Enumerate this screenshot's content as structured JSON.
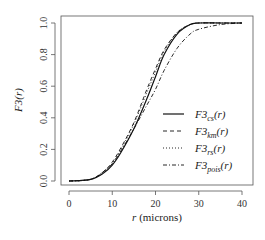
{
  "chart_data": {
    "type": "line",
    "title": "",
    "xlabel": "r (microns)",
    "ylabel": "F3(r)",
    "xlim": [
      0,
      40
    ],
    "ylim": [
      0,
      1
    ],
    "x_ticks": [
      "0",
      "10",
      "20",
      "30",
      "40"
    ],
    "y_ticks": [
      "0.0",
      "0.2",
      "0.4",
      "0.6",
      "0.8",
      "1.0"
    ],
    "grid": false,
    "legend_position": "center-right",
    "x": [
      0,
      5,
      8,
      10,
      12,
      15,
      18,
      20,
      22,
      25,
      28,
      30,
      35,
      40
    ],
    "series": [
      {
        "name": "F3_cs(r)",
        "base": "F3",
        "sub": "cs",
        "style": "solid",
        "values": [
          0,
          0.01,
          0.05,
          0.1,
          0.18,
          0.33,
          0.52,
          0.66,
          0.8,
          0.93,
          0.99,
          1.0,
          1.0,
          1.0
        ]
      },
      {
        "name": "F3_km(r)",
        "base": "F3",
        "sub": "km",
        "style": "dashed",
        "values": [
          0,
          0.01,
          0.06,
          0.12,
          0.21,
          0.37,
          0.58,
          0.71,
          0.83,
          0.94,
          0.99,
          1.0,
          1.0,
          1.0
        ]
      },
      {
        "name": "F3_rs(r)",
        "base": "F3",
        "sub": "rs",
        "style": "dotted",
        "values": [
          0,
          0.01,
          0.06,
          0.11,
          0.2,
          0.36,
          0.56,
          0.69,
          0.82,
          0.94,
          0.99,
          1.0,
          1.0,
          1.0
        ]
      },
      {
        "name": "F3_pois(r)",
        "base": "F3",
        "sub": "pois",
        "style": "dotdash",
        "values": [
          0,
          0.01,
          0.06,
          0.11,
          0.19,
          0.33,
          0.48,
          0.58,
          0.7,
          0.84,
          0.93,
          0.96,
          0.99,
          1.0
        ]
      }
    ]
  }
}
